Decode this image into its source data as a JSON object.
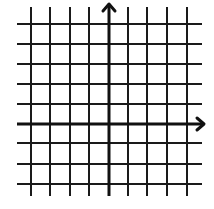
{
  "diagram": {
    "type": "coordinate-plane",
    "colors": {
      "background": "#ffffff",
      "grid_line": "#1a1a1a",
      "axis_line": "#111111"
    },
    "grid": {
      "vertical_lines_x": [
        31,
        50,
        70,
        89,
        109,
        128,
        147,
        167,
        187
      ],
      "horizontal_lines_y": [
        24,
        44,
        64,
        84,
        104,
        124,
        143,
        164,
        184
      ],
      "vertical_extent": [
        7,
        196
      ],
      "horizontal_extent": [
        17,
        202
      ],
      "line_width": 2
    },
    "axes": {
      "y_axis": {
        "x": 109,
        "from_y": 196,
        "to_y": 4,
        "arrow": "up",
        "line_width": 3
      },
      "x_axis": {
        "y": 124,
        "from_x": 17,
        "to_x": 204,
        "arrow": "right",
        "line_width": 3
      }
    }
  }
}
